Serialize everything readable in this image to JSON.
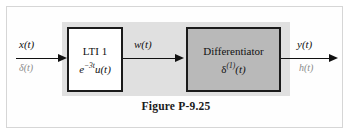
{
  "figure": {
    "caption": "Figure P-9.25",
    "colors": {
      "panel_gray": "#e0e0e0",
      "block_fill_gray": "#b9b9b9",
      "block_fill_white": "#ffffff",
      "stroke": "#1a1a1a",
      "muted_text": "#8a8a8a",
      "frame": "#d6d6d6"
    }
  },
  "blocks": [
    {
      "id": "lti-1",
      "title": "LTI 1",
      "impulse_response": {
        "base": "e",
        "exponent": "−3t",
        "tail": "u(t)"
      },
      "fill": "white"
    },
    {
      "id": "differentiator",
      "title": "Differentiator",
      "impulse_response": {
        "base": "δ",
        "exponent": "(1)",
        "tail": "(t)"
      },
      "fill": "gray"
    }
  ],
  "signals": {
    "input": {
      "primary": "x(t)",
      "secondary": "δ(t)"
    },
    "intermediate": {
      "primary": "w(t)"
    },
    "output": {
      "primary": "y(t)",
      "secondary": "h(t)"
    }
  }
}
